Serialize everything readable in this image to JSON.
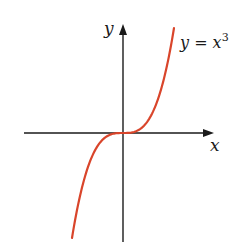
{
  "chart_data": {
    "type": "line",
    "title": "",
    "xlabel": "x",
    "ylabel": "y",
    "annotation": "y = x³",
    "function": "y = x^3",
    "grid": false,
    "legend": "none",
    "axes": {
      "arrows": true,
      "ticks": false
    },
    "series": [
      {
        "name": "y = x³",
        "color": "#d9452b",
        "x": [
          -1.0,
          -0.75,
          -0.5,
          -0.25,
          0,
          0.25,
          0.5,
          0.75,
          1.0
        ],
        "y": [
          -1.0,
          -0.42,
          -0.125,
          -0.016,
          0,
          0.016,
          0.125,
          0.42,
          1.0
        ]
      }
    ]
  },
  "labels": {
    "x_axis": "x",
    "y_axis": "y",
    "curve_lhs": "y = x",
    "curve_exp": "3"
  },
  "colors": {
    "curve": "#d9452b",
    "axes": "#1a1a1a"
  }
}
